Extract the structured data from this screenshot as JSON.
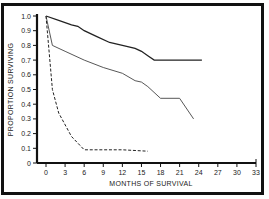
{
  "chart_data": {
    "type": "line",
    "title": "",
    "xlabel": "MONTHS OF SURVIVAL",
    "ylabel": "PROPORTION SURVIVING",
    "xlim": [
      0,
      33
    ],
    "ylim": [
      0,
      1.0
    ],
    "x_ticks": [
      "0",
      "3",
      "6",
      "9",
      "12",
      "15",
      "18",
      "21",
      "24",
      "27",
      "30",
      "33"
    ],
    "y_ticks": [
      "0",
      "0.1",
      "0.2",
      "0.3",
      "0.4",
      "0.5",
      "0.6",
      "0.7",
      "0.8",
      "0.9",
      "1.0"
    ],
    "grid": false,
    "legend": null,
    "series": [
      {
        "name": "Group A (upper solid)",
        "style": "solid-thick",
        "x": [
          0,
          2,
          4,
          5,
          6,
          8,
          10,
          12,
          14,
          15,
          16,
          17,
          19,
          21,
          24.5
        ],
        "y": [
          1.0,
          0.97,
          0.94,
          0.93,
          0.9,
          0.86,
          0.82,
          0.8,
          0.78,
          0.76,
          0.73,
          0.7,
          0.7,
          0.7,
          0.7
        ]
      },
      {
        "name": "Group B (middle solid)",
        "style": "solid-thin",
        "x": [
          0,
          1,
          3,
          6,
          9,
          12,
          14,
          15,
          16,
          18,
          21,
          23.2
        ],
        "y": [
          1.0,
          0.8,
          0.76,
          0.7,
          0.65,
          0.61,
          0.56,
          0.55,
          0.52,
          0.44,
          0.44,
          0.3
        ]
      },
      {
        "name": "Group C (dashed)",
        "style": "dashed",
        "x": [
          0,
          1,
          2,
          4,
          6,
          9,
          12,
          16
        ],
        "y": [
          1.0,
          0.5,
          0.34,
          0.18,
          0.09,
          0.09,
          0.09,
          0.08
        ]
      }
    ]
  }
}
